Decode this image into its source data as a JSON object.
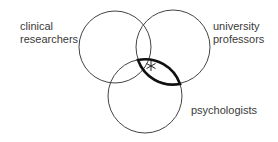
{
  "diagram": {
    "type": "venn",
    "sets": [
      {
        "label_line1": "clinical",
        "label_line2": "researchers"
      },
      {
        "label_line1": "university",
        "label_line2": "professors"
      },
      {
        "label_line1": "psychologists"
      }
    ],
    "highlight": "intersection of university professors and psychologists (bold outline)",
    "marker": "*"
  }
}
